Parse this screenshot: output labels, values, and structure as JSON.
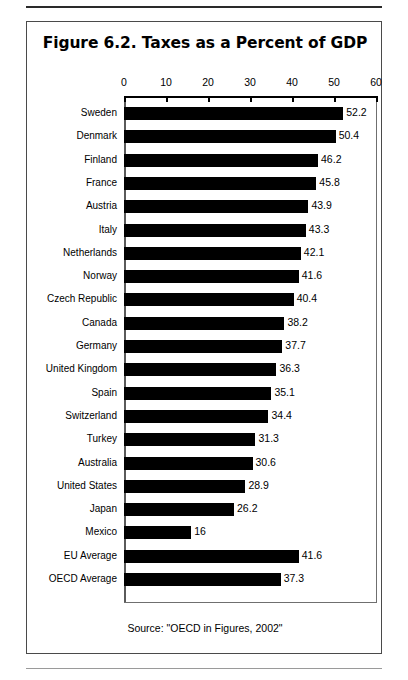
{
  "page": {
    "running_head": "",
    "source_note": "Source: \"OECD in Figures, 2002\""
  },
  "chart_data": {
    "type": "bar",
    "orientation": "horizontal",
    "title": "Figure 6.2.  Taxes as a Percent of GDP",
    "xlabel": "",
    "ylabel": "",
    "xlim": [
      0,
      60
    ],
    "xticks": [
      0,
      10,
      20,
      30,
      40,
      50,
      60
    ],
    "xtick_labels": [
      "0",
      "10",
      "20",
      "30",
      "40",
      "50",
      "60"
    ],
    "grid": false,
    "legend": false,
    "bar_color": "#000000",
    "categories": [
      "Sweden",
      "Denmark",
      "Finland",
      "France",
      "Austria",
      "Italy",
      "Netherlands",
      "Norway",
      "Czech Republic",
      "Canada",
      "Germany",
      "United Kingdom",
      "Spain",
      "Switzerland",
      "Turkey",
      "Australia",
      "United States",
      "Japan",
      "Mexico",
      "EU Average",
      "OECD Average"
    ],
    "values": [
      52.2,
      50.4,
      46.2,
      45.8,
      43.9,
      43.3,
      42.1,
      41.6,
      40.4,
      38.2,
      37.7,
      36.3,
      35.1,
      34.4,
      31.3,
      30.6,
      28.9,
      26.2,
      16,
      41.6,
      37.3
    ],
    "value_labels": [
      "52.2",
      "50.4",
      "46.2",
      "45.8",
      "43.9",
      "43.3",
      "42.1",
      "41.6",
      "40.4",
      "38.2",
      "37.7",
      "36.3",
      "35.1",
      "34.4",
      "31.3",
      "30.6",
      "28.9",
      "26.2",
      "16",
      "41.6",
      "37.3"
    ]
  }
}
